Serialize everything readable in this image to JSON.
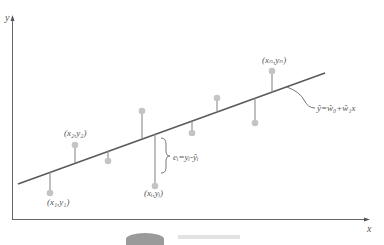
{
  "diagram": {
    "axes": {
      "x_label": "x",
      "y_label": "y"
    },
    "colors": {
      "axis": "#555555",
      "line": "#5a5a5a",
      "point": "#c4c4c4",
      "stem": "#8a8a8a",
      "text": "#555555"
    },
    "regression_line": {
      "label": "ŷ=ŵ₀+ŵ₁x"
    },
    "points": [
      {
        "label": "(x₁,y₁)"
      },
      {
        "label": "(x₂,y₂)"
      },
      {
        "label": ""
      },
      {
        "label": "(xᵢ,yᵢ)"
      },
      {
        "label": ""
      },
      {
        "label": ""
      },
      {
        "label": ""
      },
      {
        "label": ""
      },
      {
        "label": "(xₙ,yₙ)"
      }
    ],
    "residual": {
      "label": "eᵢ=yᵢ-ŷᵢ"
    }
  }
}
